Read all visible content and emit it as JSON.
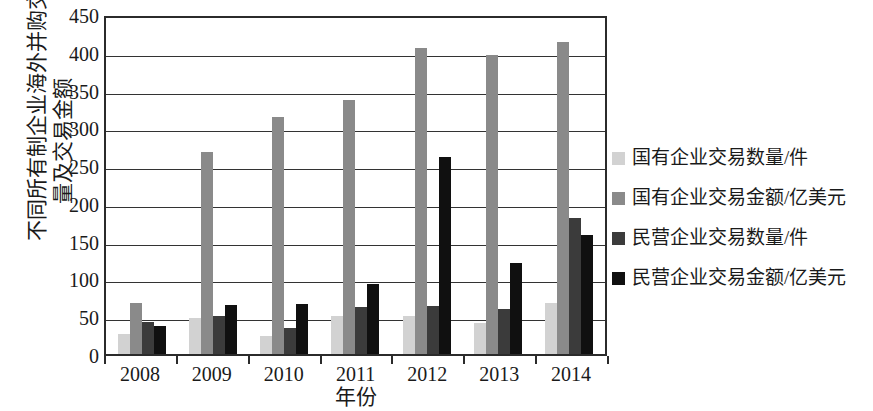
{
  "chart_data": {
    "type": "bar",
    "title": "",
    "xlabel": "年份",
    "ylabel": "不同所有制企业海外并购交易数量及交易金额",
    "ylabel_lines": [
      "不同所有制企业海外并购交易数",
      "量及交易金额"
    ],
    "categories": [
      "2008",
      "2009",
      "2010",
      "2011",
      "2012",
      "2013",
      "2014"
    ],
    "ylim": [
      0,
      450
    ],
    "yticks": [
      450,
      400,
      350,
      300,
      250,
      200,
      150,
      100,
      50,
      0
    ],
    "grid": true,
    "legend_position": "right",
    "series": [
      {
        "name": "国有企业交易数量/件",
        "color": "#d2d2d2",
        "values": [
          26,
          48,
          24,
          50,
          50,
          41,
          67
        ]
      },
      {
        "name": "国有企业交易金额/亿美元",
        "color": "#8a8a8a",
        "values": [
          68,
          268,
          314,
          336,
          405,
          396,
          413
        ]
      },
      {
        "name": "民营企业交易数量/件",
        "color": "#3b3b3b",
        "values": [
          42,
          50,
          34,
          62,
          64,
          60,
          180
        ]
      },
      {
        "name": "民营企业交易金额/亿美元",
        "color": "#101010",
        "values": [
          37,
          65,
          66,
          93,
          261,
          120,
          157
        ]
      }
    ]
  }
}
